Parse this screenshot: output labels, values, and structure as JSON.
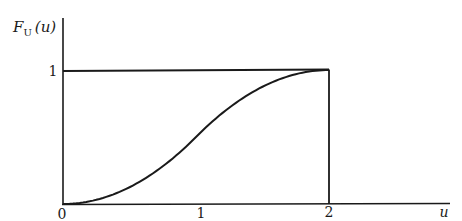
{
  "chart_data": {
    "type": "line",
    "title": "",
    "ylabel": "F_U(u)",
    "ylabel_main": "F",
    "ylabel_sub": "U",
    "ylabel_arg": "(u)",
    "xlabel": "u",
    "x_ticks": [
      "0",
      "1",
      "2"
    ],
    "y_ticks": [
      "1"
    ],
    "xlim": [
      0,
      2.9
    ],
    "ylim": [
      0,
      1.4
    ],
    "grid": false,
    "legend": null,
    "series": [
      {
        "name": "F_U(u)",
        "description": "S-shaped CDF of triangular distribution on [0,2]",
        "x": [
          0,
          0.25,
          0.5,
          0.75,
          1.0,
          1.25,
          1.5,
          1.75,
          2.0
        ],
        "y": [
          0,
          0.03,
          0.125,
          0.28,
          0.5,
          0.72,
          0.875,
          0.97,
          1.0
        ]
      }
    ],
    "reference_lines": [
      {
        "type": "horizontal",
        "y": 1,
        "x_from": 0,
        "x_to": 2
      },
      {
        "type": "vertical",
        "x": 2,
        "y_from": 0,
        "y_to": 1
      }
    ]
  },
  "colors": {
    "ink": "#1a1a1a",
    "background": "#ffffff"
  }
}
